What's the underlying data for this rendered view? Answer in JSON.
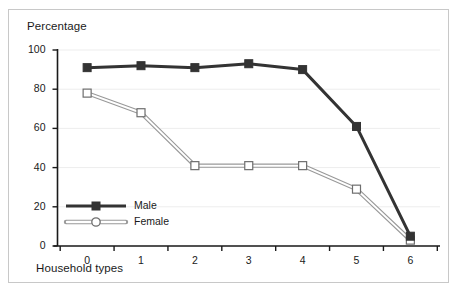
{
  "chart_data": {
    "type": "line",
    "title": "",
    "xlabel": "Household types",
    "ylabel": "Percentage",
    "x": [
      0,
      1,
      2,
      3,
      4,
      5,
      6
    ],
    "xticklabels": [
      "0",
      "1",
      "2",
      "3",
      "4",
      "5",
      "6"
    ],
    "yticklabels": [
      "0",
      "20",
      "40",
      "60",
      "80",
      "100"
    ],
    "yticks": [
      0,
      20,
      40,
      60,
      80,
      100
    ],
    "xlim": [
      -0.55,
      6.55
    ],
    "ylim": [
      0,
      100
    ],
    "grid": true,
    "legend_position": "lower-left-inside",
    "series": [
      {
        "name": "Male",
        "values": [
          91,
          92,
          91,
          93,
          90,
          61,
          5
        ],
        "color": "#333333",
        "marker": "filled-square"
      },
      {
        "name": "Female",
        "values": [
          78,
          68,
          41,
          41,
          41,
          29,
          3
        ],
        "color": "#808080",
        "marker": "open-square"
      }
    ]
  },
  "legend": {
    "items": [
      {
        "label": "Male"
      },
      {
        "label": "Female"
      }
    ]
  },
  "colors": {
    "male_line": "#333333",
    "female_line": "#999999",
    "female_fill": "#ffffff",
    "axis": "#1a1a1a",
    "grid": "#ededed",
    "frame_border": "#c8c8c8",
    "background": "#ffffff"
  }
}
